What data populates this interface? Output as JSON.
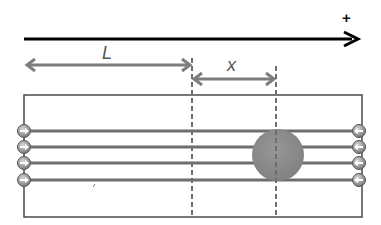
{
  "diagram": {
    "axis": {
      "direction_label": "+",
      "color": "#000000"
    },
    "labels": {
      "L": "L",
      "x": "x"
    },
    "colors": {
      "dimension_arrow": "#7d7d7d",
      "box_border": "#4a4a4a",
      "wire": "#6e6e6e",
      "dashed_line": "#6e6e6e",
      "ball_fill": "#8a8a8a",
      "charge_fill": "#9a9a9a"
    },
    "left_charges": {
      "count": 4,
      "symbol": "minus-with-right-arrow"
    },
    "right_charges": {
      "count": 4,
      "symbol": "minus-with-left-arrow"
    },
    "ball": {
      "label": ""
    }
  }
}
